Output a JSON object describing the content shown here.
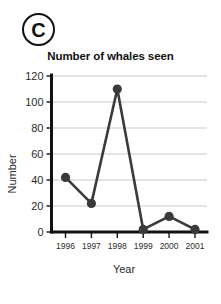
{
  "panel": {
    "label": "C"
  },
  "chart_data": {
    "type": "line",
    "title": "Number of whales seen",
    "xlabel": "Year",
    "ylabel": "Number",
    "categories": [
      "1996",
      "1997",
      "1998",
      "1999",
      "2000",
      "2001"
    ],
    "values": [
      42,
      22,
      110,
      2,
      12,
      2
    ],
    "series": [
      {
        "name": "Number of whales seen",
        "values": [
          42,
          22,
          110,
          2,
          12,
          2
        ]
      }
    ],
    "ylim": [
      0,
      120
    ],
    "yticks": [
      0,
      20,
      40,
      60,
      80,
      100,
      120
    ],
    "ytick_labels": [
      "0",
      "20",
      "40",
      "60",
      "80",
      "100",
      "120"
    ],
    "xtick_labels": [
      "1996",
      "1997",
      "1998",
      "1999",
      "2000",
      "2001"
    ],
    "grid": true,
    "grid_axis": "y",
    "legend": false,
    "legend_position": "none",
    "marker": "circle",
    "colors": {
      "line": "#3a3a3a",
      "marker": "#3a3a3a",
      "grid": "#c8c8c8",
      "axis": "#111111",
      "text": "#2a2a2a"
    }
  }
}
